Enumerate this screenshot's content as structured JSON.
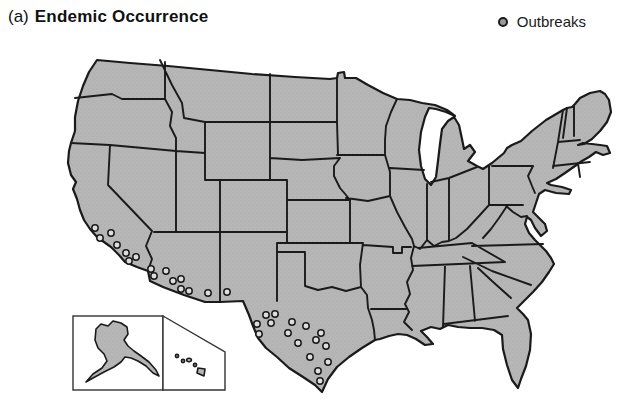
{
  "figure": {
    "label_prefix": "(a)",
    "title": "Endemic Occurrence"
  },
  "legend": {
    "label": "Outbreaks",
    "marker": "outbreak-circle-icon"
  },
  "map": {
    "type": "map-points",
    "region": "Contiguous United States with state borders",
    "insets": [
      "Alaska",
      "Hawaii"
    ],
    "shading": "entire contiguous United States shaded gray (endemic occurrence)",
    "colors": {
      "land": "#b6b6b6",
      "speckle": "#9b9b9b",
      "border": "#1a1a1a",
      "water": "#ffffff",
      "dot_fill": "#dedede",
      "legend_dot_fill": "#9a9a9a"
    },
    "outbreaks": {
      "marker": {
        "shape": "circle",
        "radius": 3.2
      },
      "regions": [
        "southern California coast",
        "southern Arizona",
        "southern New Mexico",
        "western and southern Texas"
      ],
      "points_px": [
        [
          95,
          228
        ],
        [
          111,
          233
        ],
        [
          100,
          238
        ],
        [
          117,
          245
        ],
        [
          126,
          253
        ],
        [
          136,
          257
        ],
        [
          129,
          261
        ],
        [
          151,
          269
        ],
        [
          154,
          276
        ],
        [
          166,
          271
        ],
        [
          173,
          281
        ],
        [
          181,
          279
        ],
        [
          181,
          289
        ],
        [
          189,
          291
        ],
        [
          208,
          293
        ],
        [
          227,
          292
        ],
        [
          266,
          315
        ],
        [
          275,
          314
        ],
        [
          257,
          324
        ],
        [
          271,
          323
        ],
        [
          259,
          334
        ],
        [
          292,
          322
        ],
        [
          306,
          326
        ],
        [
          288,
          333
        ],
        [
          321,
          333
        ],
        [
          316,
          340
        ],
        [
          298,
          343
        ],
        [
          326,
          346
        ],
        [
          310,
          357
        ],
        [
          328,
          362
        ],
        [
          318,
          371
        ],
        [
          320,
          381
        ]
      ]
    }
  }
}
